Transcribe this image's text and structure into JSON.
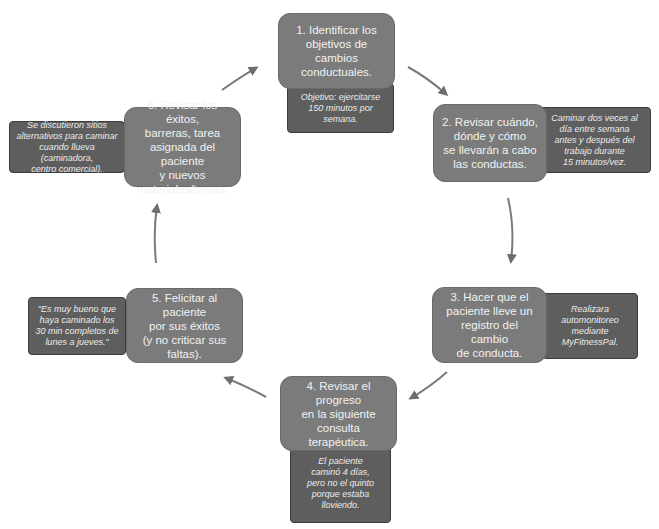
{
  "diagram": {
    "type": "cycle",
    "colors": {
      "step_box": "#7b7b7b",
      "note_box": "#5e5e5e",
      "text": "#f2f2f2",
      "arrow": "#6e6e6e"
    },
    "steps": [
      {
        "id": 1,
        "label": "1. Identificar los\nobjetivos de cambios\nconductuales.",
        "note": "Objetivo: ejercitarse\n150 minutos por\nsemana."
      },
      {
        "id": 2,
        "label": "2. Revisar cuándo,\ndónde y cómo\nse llevarán a cabo\nlas conductas.",
        "note": "Caminar dos veces al\ndía entre semana\nantes y después del\ntrabajo durante\n15 minutos/vez."
      },
      {
        "id": 3,
        "label": "3. Hacer que el\npaciente lleve un\nregistro del cambio\nde conducta.",
        "note": "Realizara\nautomonitoreo\nmediante\nMyFitnessPal."
      },
      {
        "id": 4,
        "label": "4. Revisar el progreso\nen la siguiente\nconsulta terapéutica.",
        "note": "El paciente\ncaminó 4 días,\npero no el quinto\nporque estaba\nlloviendo."
      },
      {
        "id": 5,
        "label": "5. Felicitar al paciente\npor sus éxitos\n(y no criticar sus faltas).",
        "note": "\"Es muy bueno que\nhaya caminado los\n30 min completos de\nlunes a jueves.\""
      },
      {
        "id": 6,
        "label": "6. Revisar los éxitos,\nbarreras, tarea\nasignada del paciente\ny nuevos\nmateriales/temas.",
        "note": "Se discutieron sitios\nalternativos para caminar\ncuando llueva (caminadora,\ncentro comercial)."
      }
    ],
    "edges": [
      {
        "from": 1,
        "to": 2
      },
      {
        "from": 2,
        "to": 3
      },
      {
        "from": 3,
        "to": 4
      },
      {
        "from": 4,
        "to": 5
      },
      {
        "from": 5,
        "to": 6
      },
      {
        "from": 6,
        "to": 1
      }
    ]
  }
}
